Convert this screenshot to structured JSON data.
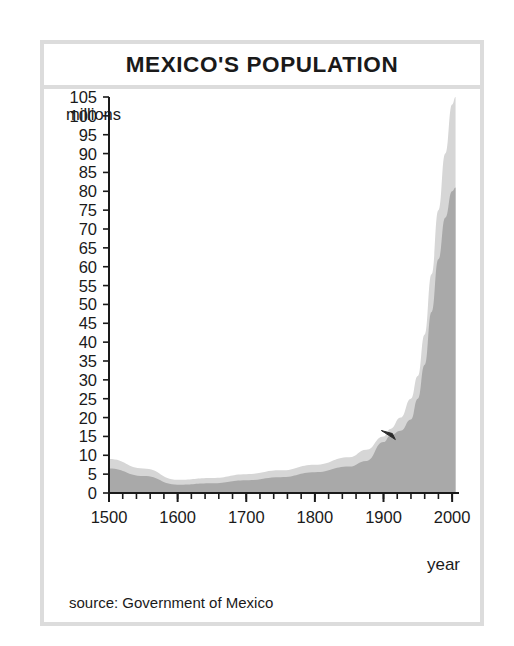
{
  "figure": {
    "title": "MEXICO'S POPULATION",
    "source_note": "source: Government of Mexico",
    "frame_color": "#dcdcdc"
  },
  "chart_data": {
    "type": "area",
    "title": "MEXICO'S POPULATION",
    "xlabel": "year",
    "ylabel": "millions",
    "xlim": [
      1500,
      2010
    ],
    "ylim": [
      0,
      105
    ],
    "grid": false,
    "legend": null,
    "x_ticks": [
      1500,
      1600,
      1700,
      1800,
      1900,
      2000
    ],
    "x_minor_step": 20,
    "y_ticks": [
      0,
      5,
      10,
      15,
      20,
      25,
      30,
      35,
      40,
      45,
      50,
      55,
      60,
      65,
      70,
      75,
      80,
      85,
      90,
      95,
      100,
      105
    ],
    "colors": {
      "upper_band": "#d6d6d6",
      "lower_band": "#a9a9a9",
      "axis": "#1a1a1a"
    },
    "series": [
      {
        "name": "upper estimate",
        "fill": "#d6d6d6",
        "x": [
          1500,
          1550,
          1600,
          1650,
          1700,
          1750,
          1800,
          1850,
          1875,
          1900,
          1910,
          1925,
          1940,
          1950,
          1960,
          1970,
          1980,
          1990,
          2000,
          2005
        ],
        "values": [
          9.0,
          6.5,
          3.5,
          4.0,
          5.0,
          6.0,
          7.5,
          9.5,
          11.5,
          15.0,
          17.0,
          20.0,
          25.0,
          31.0,
          42.0,
          58.0,
          75.0,
          90.0,
          103.0,
          105.0
        ]
      },
      {
        "name": "lower estimate",
        "fill": "#a9a9a9",
        "x": [
          1500,
          1550,
          1600,
          1650,
          1700,
          1750,
          1800,
          1850,
          1875,
          1900,
          1910,
          1925,
          1940,
          1950,
          1960,
          1970,
          1980,
          1990,
          2000,
          2005
        ],
        "values": [
          6.5,
          4.5,
          2.2,
          2.6,
          3.4,
          4.2,
          5.5,
          7.0,
          8.5,
          13.5,
          15.2,
          16.5,
          19.5,
          25.0,
          34.0,
          48.0,
          62.0,
          73.0,
          80.0,
          81.0
        ]
      }
    ],
    "annotations": [
      {
        "name": "marker-1910",
        "x": 1910,
        "y": 15.5,
        "label": ""
      }
    ]
  }
}
